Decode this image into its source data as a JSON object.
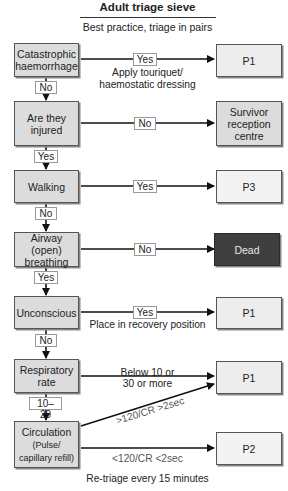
{
  "header": {
    "title": "Adult triage sieve",
    "subtitle": "Best practice, triage in pairs"
  },
  "steps": [
    {
      "id": "catastrophic",
      "label_lines": [
        "Catastrophic",
        "haemorrhage"
      ]
    },
    {
      "id": "injured",
      "label_lines": [
        "Are they",
        "injured"
      ]
    },
    {
      "id": "walking",
      "label_lines": [
        "Walking"
      ]
    },
    {
      "id": "airway",
      "label_lines": [
        "Airway (open)",
        "breathing"
      ]
    },
    {
      "id": "unconscious",
      "label_lines": [
        "Unconscious"
      ]
    },
    {
      "id": "respiratory",
      "label_lines": [
        "Respiratory",
        "rate"
      ]
    },
    {
      "id": "circulation",
      "label_lines": [
        "Circulation",
        "(Pulse/",
        "capillary refill)"
      ]
    }
  ],
  "outcomes": [
    {
      "id": "p1_a",
      "label": "P1"
    },
    {
      "id": "survivor",
      "label_lines": [
        "Survivor",
        "reception",
        "centre"
      ]
    },
    {
      "id": "p3",
      "label": "P3"
    },
    {
      "id": "dead",
      "label": "Dead"
    },
    {
      "id": "p1_b",
      "label": "P1"
    },
    {
      "id": "p1_c",
      "label": "P1"
    },
    {
      "id": "p2",
      "label": "P2"
    }
  ],
  "connectors": {
    "down_labels": [
      "No",
      "Yes",
      "No",
      "Yes",
      "No",
      "10–29"
    ],
    "across_labels": [
      "Yes",
      "No",
      "Yes",
      "No",
      "Yes"
    ]
  },
  "notes": {
    "haemorrhage_action_1": "Apply touriquet/",
    "haemorrhage_action_2": "haemostatic dressing",
    "unconscious_action": "Place in recovery position",
    "resp_criteria_1": "Below 10 or",
    "resp_criteria_2": "30 or more",
    "circ_p1": ">120/CR >2sec",
    "circ_p2": "<120/CR <2sec",
    "footer": "Re-triage every 15 minutes"
  },
  "colors": {
    "box_fill": "#dcdcdc",
    "dead_fill": "#3f3f3f",
    "line": "#111111"
  }
}
